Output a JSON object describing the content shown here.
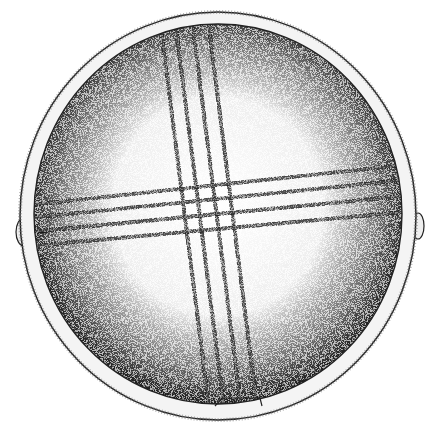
{
  "illustration": {
    "subject": "stippled drawing of a circular disc with crossed banded decoration",
    "width": 437,
    "height": 439,
    "colors": {
      "background": "#ffffff",
      "ink": "#1a1a1a",
      "stipple_dark": "#3a3a3a",
      "stipple_mid": "#8a8a8a",
      "highlight": "#ffffff"
    },
    "rim": {
      "cx": 218,
      "cy": 214,
      "rx": 200,
      "ry": 204
    },
    "disc": {
      "cx": 218,
      "cy": 214,
      "rx": 184,
      "ry": 190
    },
    "lugs": [
      {
        "name": "left-lug",
        "cx": 24,
        "cy": 232,
        "rx": 8,
        "ry": 13
      },
      {
        "name": "right-lug",
        "cx": 417,
        "cy": 226,
        "rx": 6,
        "ry": 13
      }
    ],
    "vertical_band": {
      "stripes": 4,
      "top": [
        158,
        215
      ],
      "bottom": [
        210,
        268
      ],
      "angle_note": "slightly tilted, running top to bottom"
    },
    "horizontal_band": {
      "stripes": 4,
      "left": [
        200,
        250
      ],
      "right": [
        160,
        215
      ],
      "angle_note": "slightly tilted, running left to right"
    }
  }
}
